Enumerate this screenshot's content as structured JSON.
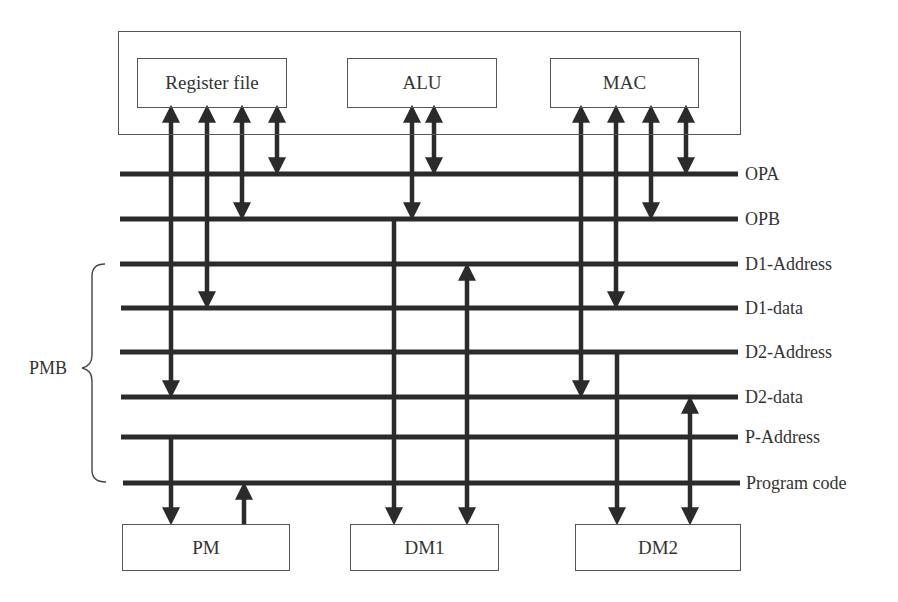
{
  "diagram": {
    "type": "bus architecture block diagram",
    "top_units": [
      {
        "id": "regfile",
        "label": "Register file"
      },
      {
        "id": "alu",
        "label": "ALU"
      },
      {
        "id": "mac",
        "label": "MAC"
      }
    ],
    "buses": [
      {
        "id": "opa",
        "label": "OPA"
      },
      {
        "id": "opb",
        "label": "OPB"
      },
      {
        "id": "d1addr",
        "label": "D1-Address"
      },
      {
        "id": "d1data",
        "label": "D1-data"
      },
      {
        "id": "d2addr",
        "label": "D2-Address"
      },
      {
        "id": "d2data",
        "label": "D2-data"
      },
      {
        "id": "paddr",
        "label": "P-Address"
      },
      {
        "id": "pcode",
        "label": "Program code"
      }
    ],
    "group_label": "PMB",
    "memories": [
      {
        "id": "pm",
        "label": "PM"
      },
      {
        "id": "dm1",
        "label": "DM1"
      },
      {
        "id": "dm2",
        "label": "DM2"
      }
    ],
    "connections": [
      {
        "from": "Register file",
        "to": "D2-data",
        "direction": "bidirectional"
      },
      {
        "from": "Register file",
        "to": "D1-data",
        "direction": "bidirectional"
      },
      {
        "from": "Register file",
        "to": "OPB",
        "direction": "bidirectional"
      },
      {
        "from": "Register file",
        "to": "OPA",
        "direction": "bidirectional"
      },
      {
        "from": "ALU",
        "to": "OPB",
        "direction": "bidirectional"
      },
      {
        "from": "ALU",
        "to": "OPA",
        "direction": "bidirectional"
      },
      {
        "from": "MAC",
        "to": "D2-data",
        "direction": "bidirectional"
      },
      {
        "from": "MAC",
        "to": "D1-data",
        "direction": "bidirectional"
      },
      {
        "from": "MAC",
        "to": "OPB",
        "direction": "bidirectional"
      },
      {
        "from": "MAC",
        "to": "OPA",
        "direction": "bidirectional"
      },
      {
        "from": "P-Address",
        "to": "PM",
        "direction": "down"
      },
      {
        "from": "PM",
        "to": "Program code",
        "direction": "up"
      },
      {
        "from": "OPB",
        "to": "DM1",
        "direction": "down"
      },
      {
        "from": "D1-Address",
        "to": "DM1",
        "direction": "bidirectional"
      },
      {
        "from": "D2-Address",
        "to": "DM2",
        "direction": "down"
      },
      {
        "from": "D2-data",
        "to": "DM2",
        "direction": "bidirectional"
      }
    ],
    "colors": {
      "line": "#2b2b2b",
      "box_border": "#555555",
      "text": "#333333",
      "background": "#ffffff"
    }
  }
}
